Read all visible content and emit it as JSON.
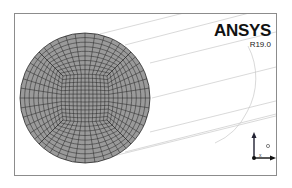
{
  "app": {
    "logo_title": "ANSYS",
    "version": "R19.0"
  },
  "viewport": {
    "content": "meshed circular cross-section (O-grid) with wireframe cylinder",
    "mesh_fill_color": "#9a9a9a",
    "mesh_line_color": "#2a2a2a",
    "frame_color": "#8c8c8c"
  },
  "triad": {
    "icon": "axis-triad-icon",
    "axis_label": "x"
  }
}
